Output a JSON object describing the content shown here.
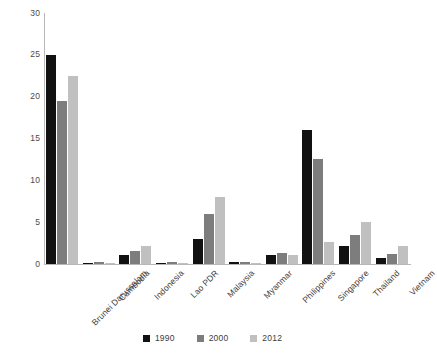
{
  "chart_data": {
    "type": "bar",
    "title": "",
    "subtitle": "",
    "xlabel": "",
    "ylabel": "",
    "ylim": [
      0,
      30
    ],
    "yticks": [
      0,
      5,
      10,
      15,
      20,
      25,
      30
    ],
    "grid": false,
    "legend_position": "bottom",
    "categories": [
      "Brunei Darussalam",
      "Cambodia",
      "Indonesia",
      "Lao PDR",
      "Malaysia",
      "Myanmar",
      "Philippines",
      "Singapore",
      "Thailand",
      "Vietnam"
    ],
    "series": [
      {
        "name": "1990",
        "color": "#111111",
        "values": [
          25.0,
          0.1,
          1.1,
          0.15,
          3.0,
          0.2,
          1.1,
          16.0,
          2.1,
          0.7
        ]
      },
      {
        "name": "2000",
        "color": "#7d7d7d",
        "values": [
          19.5,
          0.3,
          1.6,
          0.3,
          6.0,
          0.2,
          1.3,
          12.5,
          3.5,
          1.2
        ]
      },
      {
        "name": "2012",
        "color": "#c0c0c0",
        "values": [
          22.5,
          0.15,
          2.1,
          0.05,
          8.0,
          0.15,
          1.1,
          2.6,
          5.0,
          2.1
        ]
      }
    ]
  },
  "legend": {
    "items": [
      {
        "label": "1990"
      },
      {
        "label": "2000"
      },
      {
        "label": "2012"
      }
    ]
  }
}
